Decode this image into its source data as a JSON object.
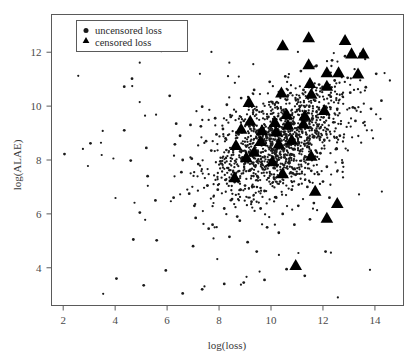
{
  "figure": {
    "name": "scatter-plot-loss-alae",
    "background": "#ffffff",
    "frame_color": "#5a5a5a",
    "marker_color": "#000000"
  },
  "legend": {
    "position": "top-left-inside",
    "entries": [
      {
        "label": "uncensored loss",
        "marker": "circle-icon",
        "marker_type": "circle"
      },
      {
        "label": "censored loss",
        "marker": "triangle-icon",
        "marker_type": "triangle"
      }
    ]
  },
  "chart_data": {
    "type": "scatter",
    "title": "",
    "xlabel": "log(loss)",
    "ylabel": "log(ALAE)",
    "xlim": [
      1.55,
      15.1
    ],
    "ylim": [
      2.6,
      13.4
    ],
    "xticks": [
      2,
      4,
      6,
      8,
      10,
      12,
      14
    ],
    "yticks": [
      4,
      6,
      8,
      10,
      12
    ],
    "grid": false,
    "legend_position": "upper left",
    "series": [
      {
        "name": "uncensored loss",
        "marker": "circle",
        "color": "#1a1a1a",
        "size": 1.4,
        "points": [
          [
            2.05,
            8.22
          ],
          [
            3.05,
            8.62
          ],
          [
            4.35,
            9.1
          ],
          [
            4.65,
            11.02
          ],
          [
            4.35,
            10.72
          ],
          [
            4.6,
            7.98
          ],
          [
            5.2,
            8.45
          ],
          [
            5.25,
            7.4
          ],
          [
            5.55,
            6.5
          ],
          [
            4.95,
            6.05
          ],
          [
            4.7,
            5.05
          ],
          [
            5.6,
            5.02
          ],
          [
            5.95,
            3.9
          ],
          [
            6.3,
            8.58
          ],
          [
            6.35,
            9.35
          ],
          [
            6.1,
            10.38
          ],
          [
            6.6,
            8.0
          ],
          [
            6.55,
            7.55
          ],
          [
            6.95,
            8.05
          ],
          [
            6.5,
            8.9
          ],
          [
            6.9,
            9.3
          ],
          [
            6.85,
            6.75
          ],
          [
            7.1,
            5.85
          ],
          [
            6.25,
            6.6
          ],
          [
            7.35,
            9.98
          ],
          [
            7.3,
            9.25
          ],
          [
            7.5,
            8.7
          ],
          [
            7.2,
            7.85
          ],
          [
            7.55,
            7.05
          ],
          [
            7.05,
            6.3
          ],
          [
            7.6,
            5.45
          ],
          [
            7.0,
            4.8
          ],
          [
            7.85,
            9.55
          ],
          [
            7.9,
            8.95
          ],
          [
            7.7,
            8.35
          ],
          [
            8.05,
            7.95
          ],
          [
            8.15,
            9.15
          ],
          [
            7.95,
            6.9
          ],
          [
            8.2,
            6.2
          ],
          [
            7.75,
            5.6
          ],
          [
            8.3,
            10.05
          ],
          [
            8.45,
            9.6
          ],
          [
            8.25,
            8.8
          ],
          [
            8.55,
            8.4
          ],
          [
            8.35,
            7.7
          ],
          [
            8.6,
            7.2
          ],
          [
            8.5,
            6.55
          ],
          [
            8.7,
            5.9
          ],
          [
            8.4,
            5.15
          ],
          [
            8.85,
            10.3
          ],
          [
            8.95,
            9.45
          ],
          [
            8.75,
            8.95
          ],
          [
            9.05,
            8.5
          ],
          [
            8.9,
            8.1
          ],
          [
            9.15,
            7.6
          ],
          [
            9.0,
            7.05
          ],
          [
            9.25,
            6.45
          ],
          [
            8.8,
            5.75
          ],
          [
            9.1,
            4.95
          ],
          [
            9.35,
            10.6
          ],
          [
            9.45,
            9.85
          ],
          [
            9.3,
            9.3
          ],
          [
            9.55,
            8.85
          ],
          [
            9.4,
            8.3
          ],
          [
            9.65,
            7.85
          ],
          [
            9.5,
            7.35
          ],
          [
            9.75,
            6.85
          ],
          [
            9.6,
            6.2
          ],
          [
            9.85,
            5.5
          ],
          [
            9.45,
            4.6
          ],
          [
            9.95,
            10.9
          ],
          [
            10.05,
            10.15
          ],
          [
            9.9,
            9.6
          ],
          [
            10.15,
            9.1
          ],
          [
            10.0,
            8.6
          ],
          [
            10.25,
            8.15
          ],
          [
            10.1,
            7.7
          ],
          [
            10.35,
            7.2
          ],
          [
            10.2,
            6.6
          ],
          [
            10.45,
            6.0
          ],
          [
            10.3,
            5.3
          ],
          [
            10.55,
            11.1
          ],
          [
            10.65,
            10.4
          ],
          [
            10.5,
            9.8
          ],
          [
            10.75,
            9.35
          ],
          [
            10.6,
            8.85
          ],
          [
            10.85,
            8.4
          ],
          [
            10.7,
            7.95
          ],
          [
            10.95,
            7.45
          ],
          [
            10.8,
            6.9
          ],
          [
            11.05,
            6.3
          ],
          [
            10.9,
            5.6
          ],
          [
            11.15,
            11.3
          ],
          [
            11.25,
            10.6
          ],
          [
            11.1,
            10.0
          ],
          [
            11.35,
            9.55
          ],
          [
            11.2,
            9.05
          ],
          [
            11.45,
            8.6
          ],
          [
            11.3,
            8.1
          ],
          [
            11.55,
            7.6
          ],
          [
            11.4,
            7.0
          ],
          [
            11.65,
            6.4
          ],
          [
            11.5,
            5.8
          ],
          [
            11.75,
            11.5
          ],
          [
            11.85,
            10.8
          ],
          [
            11.7,
            10.2
          ],
          [
            11.95,
            9.75
          ],
          [
            11.8,
            9.25
          ],
          [
            12.05,
            8.75
          ],
          [
            11.9,
            8.25
          ],
          [
            12.15,
            7.75
          ],
          [
            12.0,
            7.2
          ],
          [
            12.25,
            6.6
          ],
          [
            12.35,
            11.7
          ],
          [
            12.45,
            10.95
          ],
          [
            12.3,
            10.35
          ],
          [
            12.55,
            9.9
          ],
          [
            12.4,
            9.4
          ],
          [
            12.65,
            8.9
          ],
          [
            12.5,
            8.4
          ],
          [
            12.75,
            7.9
          ],
          [
            12.85,
            11.85
          ],
          [
            12.95,
            11.05
          ],
          [
            13.05,
            10.5
          ],
          [
            13.15,
            9.95
          ],
          [
            13.25,
            9.45
          ],
          [
            13.45,
            11.95
          ],
          [
            13.65,
            10.7
          ],
          [
            13.85,
            9.9
          ],
          [
            14.05,
            11.2
          ],
          [
            14.25,
            10.2
          ],
          [
            12.1,
            4.6
          ],
          [
            11.3,
            3.7
          ],
          [
            10.6,
            3.95
          ],
          [
            9.75,
            3.55
          ],
          [
            8.95,
            3.45
          ],
          [
            8.2,
            3.4
          ],
          [
            7.35,
            3.2
          ],
          [
            6.6,
            3.05
          ],
          [
            5.1,
            3.35
          ],
          [
            4.05,
            3.6
          ]
        ]
      },
      {
        "name": "censored loss",
        "marker": "triangle",
        "color": "#000000",
        "size": 6.2,
        "points": [
          [
            11.45,
            12.55
          ],
          [
            12.85,
            12.45
          ],
          [
            13.55,
            11.95
          ],
          [
            13.1,
            11.95
          ],
          [
            10.45,
            12.25
          ],
          [
            11.45,
            11.55
          ],
          [
            12.15,
            11.25
          ],
          [
            12.6,
            11.25
          ],
          [
            13.35,
            11.2
          ],
          [
            11.5,
            10.85
          ],
          [
            12.15,
            10.75
          ],
          [
            10.4,
            10.5
          ],
          [
            11.55,
            10.45
          ],
          [
            9.15,
            10.15
          ],
          [
            10.6,
            9.7
          ],
          [
            11.3,
            9.65
          ],
          [
            12.05,
            9.85
          ],
          [
            9.2,
            9.45
          ],
          [
            10.15,
            9.4
          ],
          [
            10.65,
            9.3
          ],
          [
            11.25,
            9.35
          ],
          [
            8.85,
            9.15
          ],
          [
            9.65,
            9.1
          ],
          [
            10.2,
            9.05
          ],
          [
            10.8,
            8.75
          ],
          [
            9.6,
            8.7
          ],
          [
            10.3,
            8.6
          ],
          [
            8.65,
            8.55
          ],
          [
            9.35,
            8.3
          ],
          [
            11.55,
            8.15
          ],
          [
            9.05,
            8.1
          ],
          [
            10.05,
            7.95
          ],
          [
            10.45,
            7.5
          ],
          [
            8.6,
            7.35
          ],
          [
            11.7,
            6.85
          ],
          [
            12.55,
            6.4
          ],
          [
            12.15,
            5.85
          ],
          [
            10.95,
            4.1
          ]
        ]
      }
    ]
  }
}
